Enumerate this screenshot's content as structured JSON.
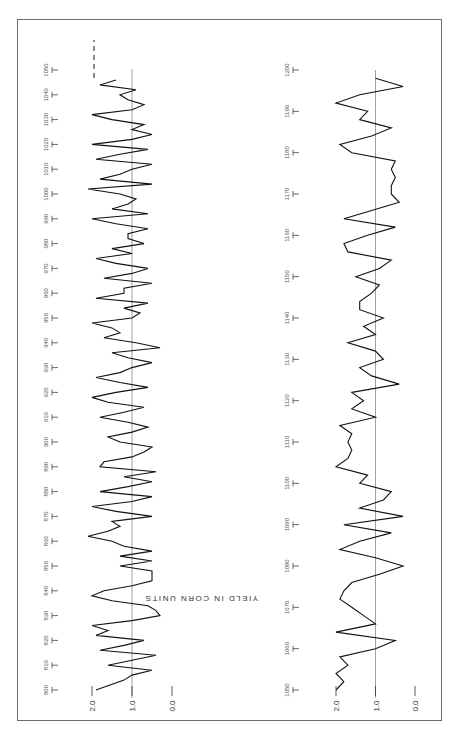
{
  "chart_data": [
    {
      "type": "line",
      "title": "",
      "orientation": "rotated 90 degrees (time runs bottom-to-top, yield increases right-to-left)",
      "xlabel": "Year",
      "ylabel": "YIELD IN CORN UNITS",
      "x_ticks": [
        800,
        810,
        820,
        830,
        840,
        850,
        860,
        870,
        880,
        890,
        900,
        910,
        920,
        930,
        940,
        950,
        960,
        970,
        980,
        990,
        1000,
        1010,
        1020,
        1030,
        1040,
        1050
      ],
      "y_ticks": [
        "0.0",
        "1.0",
        "2.0"
      ],
      "ylim": [
        0,
        2.2
      ],
      "reference_line": 1.0,
      "grid": false,
      "series": [
        {
          "name": "Yield 800-1050",
          "x": [
            800,
            804,
            806,
            808,
            810,
            812,
            814,
            816,
            818,
            820,
            822,
            824,
            826,
            828,
            830,
            832,
            834,
            836,
            838,
            840,
            842,
            844,
            846,
            848,
            850,
            852,
            854,
            856,
            858,
            860,
            862,
            864,
            866,
            868,
            870,
            872,
            874,
            876,
            878,
            880,
            882,
            884,
            886,
            888,
            890,
            892,
            894,
            896,
            898,
            900,
            902,
            904,
            906,
            908,
            910,
            912,
            914,
            916,
            918,
            920,
            922,
            924,
            926,
            928,
            930,
            932,
            934,
            936,
            938,
            940,
            942,
            944,
            946,
            948,
            950,
            952,
            954,
            956,
            958,
            960,
            962,
            964,
            966,
            968,
            970,
            972,
            974,
            976,
            978,
            980,
            982,
            984,
            986,
            988,
            990,
            992,
            994,
            996,
            998,
            1000,
            1002,
            1004,
            1006,
            1008,
            1010,
            1012,
            1014,
            1016,
            1018,
            1020,
            1022,
            1024,
            1026,
            1028,
            1030,
            1032,
            1034,
            1036,
            1038,
            1040,
            1042,
            1044,
            1046
          ],
          "values": [
            1.9,
            1.2,
            1.0,
            0.5,
            1.6,
            1.0,
            0.4,
            1.8,
            1.2,
            0.7,
            1.9,
            1.6,
            2.0,
            1.0,
            0.3,
            0.4,
            0.6,
            1.5,
            2.0,
            1.7,
            1.0,
            0.5,
            0.5,
            0.5,
            1.3,
            0.5,
            1.3,
            0.5,
            1.2,
            1.5,
            2.1,
            1.6,
            1.3,
            1.5,
            0.5,
            1.4,
            2.0,
            1.0,
            0.5,
            1.8,
            1.1,
            0.5,
            1.2,
            0.4,
            1.8,
            1.7,
            1.0,
            0.7,
            0.5,
            1.3,
            1.6,
            1.0,
            0.6,
            1.1,
            1.8,
            1.2,
            0.7,
            1.6,
            2.0,
            1.4,
            0.6,
            1.3,
            1.9,
            1.3,
            1.0,
            0.5,
            1.1,
            1.5,
            0.3,
            0.9,
            1.7,
            1.3,
            1.5,
            2.0,
            1.0,
            0.8,
            1.2,
            0.6,
            1.9,
            1.2,
            1.2,
            0.5,
            1.7,
            1.0,
            0.6,
            1.4,
            1.9,
            1.0,
            1.5,
            0.7,
            1.1,
            1.1,
            0.6,
            1.4,
            2.0,
            0.6,
            1.5,
            1.1,
            0.9,
            1.3,
            2.1,
            0.5,
            1.8,
            1.3,
            1.0,
            0.5,
            1.9,
            1.3,
            0.6,
            2.0,
            1.0,
            0.5,
            1.0,
            0.7,
            1.5,
            2.0,
            1.0,
            0.7,
            1.1,
            1.3,
            0.9,
            1.8,
            1.4
          ]
        }
      ]
    },
    {
      "type": "line",
      "title": "",
      "orientation": "rotated 90 degrees (time runs bottom-to-top, yield increases right-to-left)",
      "xlabel": "Year",
      "ylabel": "YIELD IN CORN UNITS",
      "x_ticks": [
        1050,
        1060,
        1070,
        1080,
        1090,
        1100,
        1110,
        1120,
        1130,
        1140,
        1150,
        1160,
        1170,
        1180,
        1190,
        1200
      ],
      "y_ticks": [
        "0.0",
        "1.0",
        "2.0"
      ],
      "ylim": [
        0,
        2.2
      ],
      "reference_line": 1.0,
      "grid": false,
      "series": [
        {
          "name": "Yield 1050-1200",
          "x": [
            1050,
            1052,
            1054,
            1056,
            1058,
            1060,
            1062,
            1064,
            1066,
            1068,
            1070,
            1072,
            1074,
            1076,
            1078,
            1080,
            1082,
            1084,
            1086,
            1088,
            1090,
            1092,
            1094,
            1096,
            1098,
            1100,
            1102,
            1104,
            1106,
            1108,
            1110,
            1112,
            1114,
            1116,
            1118,
            1120,
            1122,
            1124,
            1126,
            1128,
            1130,
            1132,
            1134,
            1136,
            1138,
            1140,
            1142,
            1144,
            1146,
            1148,
            1150,
            1152,
            1154,
            1156,
            1158,
            1160,
            1162,
            1164,
            1166,
            1168,
            1170,
            1172,
            1174,
            1176,
            1178,
            1180,
            1182,
            1184,
            1186,
            1188,
            1190,
            1192,
            1194,
            1196,
            1198
          ],
          "values": [
            2.0,
            1.8,
            2.0,
            1.7,
            1.9,
            1.0,
            0.5,
            2.0,
            1.0,
            1.3,
            1.6,
            1.9,
            1.8,
            1.6,
            0.9,
            0.3,
            1.0,
            1.9,
            1.4,
            0.6,
            1.8,
            0.3,
            1.4,
            0.8,
            0.6,
            1.4,
            1.2,
            2.0,
            1.7,
            1.6,
            1.7,
            1.6,
            1.9,
            1.0,
            1.6,
            1.3,
            1.6,
            0.4,
            1.1,
            1.4,
            0.8,
            1.0,
            1.7,
            1.0,
            1.3,
            0.8,
            1.4,
            1.4,
            1.1,
            0.9,
            1.5,
            0.9,
            0.6,
            1.7,
            1.8,
            1.2,
            0.5,
            1.8,
            1.1,
            0.4,
            0.6,
            0.6,
            0.5,
            0.6,
            0.5,
            1.6,
            1.9,
            1.1,
            0.6,
            1.4,
            1.2,
            2.0,
            1.4,
            0.3,
            1.0
          ]
        }
      ]
    }
  ],
  "labels": {
    "ylabel": "YIELD IN CORN UNITS",
    "panel1_ticks": [
      "800",
      "810",
      "820",
      "830",
      "840",
      "850",
      "860",
      "870",
      "880",
      "890",
      "900",
      "910",
      "920",
      "930",
      "940",
      "950",
      "960",
      "970",
      "980",
      "990",
      "1000",
      "1010",
      "1020",
      "1030",
      "1040",
      "1050"
    ],
    "panel2_ticks": [
      "1050",
      "1060",
      "1070",
      "1080",
      "1090",
      "1100",
      "1110",
      "1120",
      "1130",
      "1140",
      "1150",
      "1160",
      "1170",
      "1180",
      "1190",
      "1200"
    ],
    "y_tick_labels": [
      "2.0",
      "1.0",
      "0.0"
    ]
  }
}
